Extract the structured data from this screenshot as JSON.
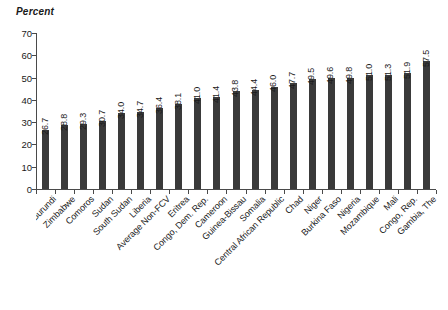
{
  "axis_title": "Percent",
  "top_cutoff_remnant": "· · ·",
  "chart_data": {
    "type": "bar",
    "title": "",
    "subtitle": "",
    "xlabel": "",
    "ylabel": "Percent",
    "ylim": [
      0,
      70
    ],
    "ytick_labels": [
      "0",
      "10",
      "20",
      "30",
      "40",
      "50",
      "60",
      "70"
    ],
    "ytick_values": [
      0,
      10,
      20,
      30,
      40,
      50,
      60,
      70
    ],
    "grid": false,
    "legend": false,
    "bar_color": "#3a3a3a",
    "axis_color": "#4a4a4a",
    "value_label_rotation": -90,
    "category_label_rotation": -45,
    "categories": [
      "Burundi",
      "Zimbabwe",
      "Comoros",
      "Sudan",
      "South Sudan",
      "Liberia",
      "Average Non-FCV",
      "Eritrea",
      "Congo, Dem. Rep.",
      "Cameroon",
      "Guinea-Bissau",
      "Somalia",
      "Central African Republic",
      "Chad",
      "Niger",
      "Burkina Faso",
      "Nigeria",
      "Mozambique",
      "Mali",
      "Congo, Rep.",
      "Gambia, The"
    ],
    "values": [
      26.7,
      28.8,
      29.3,
      30.7,
      34.0,
      34.7,
      36.4,
      38.1,
      41.0,
      41.4,
      43.8,
      44.4,
      46.0,
      47.7,
      49.5,
      49.6,
      49.8,
      51.0,
      51.3,
      51.9,
      57.5
    ],
    "value_labels": [
      "26.7",
      "28.8",
      "29.3",
      "30.7",
      "34.0",
      "34.7",
      "36.4",
      "38.1",
      "41.0",
      "41.4",
      "43.8",
      "44.4",
      "46.0",
      "47.7",
      "49.5",
      "49.6",
      "49.8",
      "51.0",
      "51.3",
      "51.9",
      "57.5"
    ]
  }
}
